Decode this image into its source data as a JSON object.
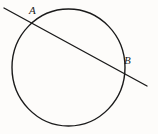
{
  "figure": {
    "background_color": "#fdfcfa",
    "stroke_color": "#1a1a1a",
    "labels": {
      "point_a": "A",
      "point_b": "B"
    },
    "circle": {
      "center_x": 68.5,
      "center_y": 67.5,
      "radius_x": 56.5,
      "radius_y": 58.5,
      "stroke_width": 1.4
    },
    "secant_line": {
      "x1": 4,
      "y1": 8,
      "x2": 147,
      "y2": 86,
      "stroke_width": 1.4
    },
    "intersections": [
      {
        "name": "A",
        "x": 31,
        "y": 22
      },
      {
        "name": "B",
        "x": 120,
        "y": 71
      }
    ]
  },
  "chart_data": {
    "type": "diagram",
    "shapes": [
      {
        "kind": "circle",
        "cx": 68.5,
        "cy": 67.5,
        "rx": 56.5,
        "ry": 58.5
      },
      {
        "kind": "line",
        "x1": 4,
        "y1": 8,
        "x2": 147,
        "y2": 86
      }
    ],
    "annotations": [
      {
        "text": "A",
        "x": 33,
        "y": 12
      },
      {
        "text": "B",
        "x": 128,
        "y": 61
      }
    ]
  }
}
